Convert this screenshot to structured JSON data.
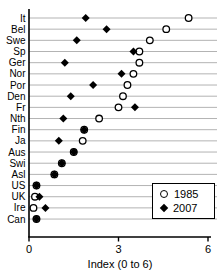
{
  "chart_data": {
    "type": "scatter",
    "title": "",
    "xlabel": "Index (0 to 6)",
    "ylabel": "",
    "xlim": [
      0,
      6
    ],
    "xticks": [
      "0",
      "3",
      "6"
    ],
    "xtick_values": [
      0,
      3,
      6
    ],
    "grid": "horizontal",
    "legend_position": "bottom-right",
    "categories": [
      "It",
      "Bel",
      "Swe",
      "Sp",
      "Ger",
      "Nor",
      "Por",
      "Den",
      "Fr",
      "Nth",
      "Fin",
      "Ja",
      "Aus",
      "Swi",
      "Asl",
      "US",
      "UK",
      "Ire",
      "Can"
    ],
    "series": [
      {
        "name": "1985",
        "marker": "open-circle",
        "values": [
          5.35,
          4.6,
          4.05,
          3.7,
          3.7,
          3.5,
          3.3,
          3.15,
          3.0,
          2.35,
          1.85,
          1.8,
          1.5,
          1.1,
          0.85,
          0.25,
          0.2,
          0.15,
          0.25
        ]
      },
      {
        "name": "2007",
        "marker": "filled-diamond",
        "values": [
          1.9,
          2.6,
          1.6,
          3.5,
          1.2,
          3.1,
          2.15,
          1.4,
          3.55,
          1.15,
          1.85,
          1.0,
          1.5,
          1.1,
          0.85,
          0.25,
          0.35,
          0.55,
          0.25
        ]
      }
    ]
  },
  "colors": {
    "background": "#ffffff",
    "text": "#000000",
    "axis": "#000000",
    "gridline": "#b3b3b3",
    "marker": "#000000",
    "marker_fill_open": "#ffffff"
  }
}
